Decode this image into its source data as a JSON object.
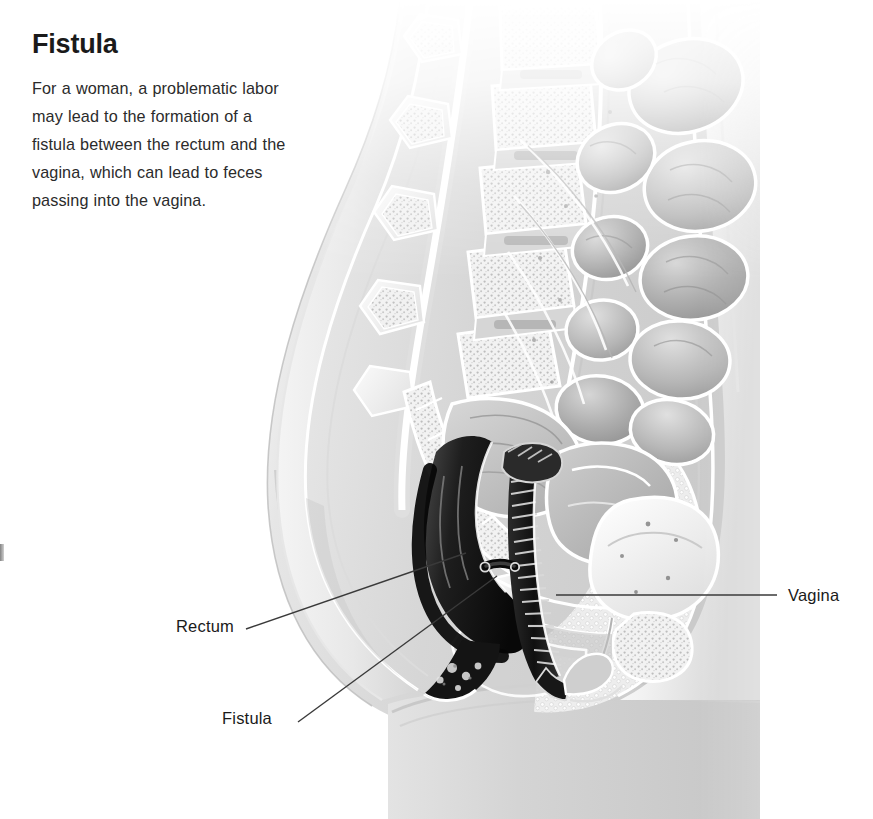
{
  "page": {
    "title": "Fistula",
    "body": "For a woman, a problematic labor may lead to the formation of a fistula between the rectum and the vagina, which can lead to feces passing into the vagina."
  },
  "illustration": {
    "name": "female-pelvis-sagittal-cross-section",
    "description": "Grayscale medical illustration: sagittal cross-section of a female pelvis showing the lumbar spine, sacrum, intestinal loops, bladder, uterus, rectum and vagina, with an abnormal fistula channel connecting the rectum and the vagina.",
    "palette": {
      "background": "#ffffff",
      "skin_silhouette": "#d5d5d5",
      "skin_silhouette_dark": "#bdbdbd",
      "tissue_light": "#ededed",
      "tissue_mid": "#c4c4c4",
      "tissue_dark": "#8f8f8f",
      "lumen_dark": "#2a2a2a",
      "lumen_black": "#111111",
      "outline": "#ffffff",
      "leader_line": "#3a3a3a"
    }
  },
  "callouts": [
    {
      "id": "rectum",
      "label": "Rectum",
      "side": "left",
      "label_x": 176,
      "label_y": 617,
      "line": {
        "x1": 246,
        "y1": 629,
        "x2": 466,
        "y2": 553
      }
    },
    {
      "id": "fistula",
      "label": "Fistula",
      "side": "left",
      "label_x": 222,
      "label_y": 709,
      "line": {
        "x1": 298,
        "y1": 722,
        "x2": 497,
        "y2": 576
      }
    },
    {
      "id": "vagina",
      "label": "Vagina",
      "side": "right",
      "label_x": 788,
      "label_y": 586,
      "line": {
        "x1": 556,
        "y1": 595,
        "x2": 777,
        "y2": 595
      }
    }
  ]
}
